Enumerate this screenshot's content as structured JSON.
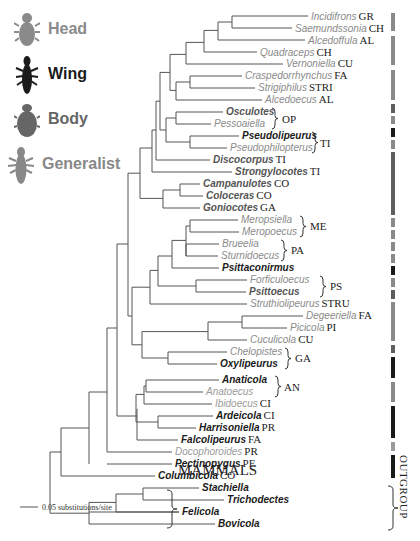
{
  "legend": {
    "items": [
      {
        "label": "Head",
        "color": "#8a8a8a"
      },
      {
        "label": "Wing",
        "color": "#1a1a1a"
      },
      {
        "label": "Body",
        "color": "#666666"
      },
      {
        "label": "Generalist",
        "color": "#888888"
      }
    ]
  },
  "colors": {
    "head": "#8a8a8a",
    "wing": "#1a1a1a",
    "body": "#5e5e5e",
    "generalist": "#9a9a9a",
    "line": "#555555"
  },
  "tips": [
    {
      "name": "Incidifrons",
      "code": "GR",
      "type": "head"
    },
    {
      "name": "Saemundssonia",
      "code": "CH",
      "type": "head"
    },
    {
      "name": "Alcedoffula",
      "code": "AL",
      "type": "head"
    },
    {
      "name": "Quadraceps",
      "code": "CH",
      "type": "head"
    },
    {
      "name": "Vernoniella",
      "code": "CU",
      "type": "head"
    },
    {
      "name": "Craspedorrhynchus",
      "code": "FA",
      "type": "head"
    },
    {
      "name": "Strigiphilus",
      "code": "STRI",
      "type": "head"
    },
    {
      "name": "Alcedoecus",
      "code": "AL",
      "type": "head"
    },
    {
      "name": "Osculotes",
      "code": "",
      "type": "body"
    },
    {
      "name": "Pessoaiella",
      "code": "",
      "type": "head"
    },
    {
      "name": "Pseudolipeurus",
      "code": "",
      "type": "wing"
    },
    {
      "name": "Pseudophilopterus",
      "code": "",
      "type": "head"
    },
    {
      "name": "Discocorpus",
      "code": "TI",
      "type": "body"
    },
    {
      "name": "Strongylocotes",
      "code": "TI",
      "type": "body"
    },
    {
      "name": "Campanulotes",
      "code": "CO",
      "type": "body"
    },
    {
      "name": "Coloceras",
      "code": "CO",
      "type": "body"
    },
    {
      "name": "Goniocotes",
      "code": "GA",
      "type": "body"
    },
    {
      "name": "Meropsiella",
      "code": "",
      "type": "head"
    },
    {
      "name": "Meropoecus",
      "code": "",
      "type": "head"
    },
    {
      "name": "Brueelia",
      "code": "",
      "type": "head"
    },
    {
      "name": "Sturnidoecus",
      "code": "",
      "type": "head"
    },
    {
      "name": "Psittaconirmus",
      "code": "",
      "type": "wing"
    },
    {
      "name": "Forficuloecus",
      "code": "",
      "type": "head"
    },
    {
      "name": "Psittoecus",
      "code": "",
      "type": "body"
    },
    {
      "name": "Struthiolipeurus",
      "code": "STRU",
      "type": "head"
    },
    {
      "name": "Degeeriella",
      "code": "FA",
      "type": "head"
    },
    {
      "name": "Picicola",
      "code": "PI",
      "type": "head"
    },
    {
      "name": "Cuculicola",
      "code": "CU",
      "type": "head"
    },
    {
      "name": "Chelopistes",
      "code": "",
      "type": "head"
    },
    {
      "name": "Oxylipeurus",
      "code": "",
      "type": "wing"
    },
    {
      "name": "Anaticola",
      "code": "",
      "type": "wing"
    },
    {
      "name": "Anatoecus",
      "code": "",
      "type": "generalist"
    },
    {
      "name": "Ibidoecus",
      "code": "CI",
      "type": "generalist"
    },
    {
      "name": "Ardeicola",
      "code": "CI",
      "type": "wing"
    },
    {
      "name": "Harrisoniella",
      "code": "PR",
      "type": "wing"
    },
    {
      "name": "Falcolipeurus",
      "code": "FA",
      "type": "wing"
    },
    {
      "name": "Docophoroides",
      "code": "PR",
      "type": "generalist"
    },
    {
      "name": "Pectinopygus",
      "code": "PE",
      "type": "wing"
    },
    {
      "name": "Columbicola",
      "code": "CO",
      "type": "wing"
    },
    {
      "name": "Stachiella",
      "code": "",
      "type": "wing"
    },
    {
      "name": "Trichodectes",
      "code": "",
      "type": "wing"
    },
    {
      "name": "Felicola",
      "code": "",
      "type": "wing"
    },
    {
      "name": "Bovicola",
      "code": "",
      "type": "wing"
    }
  ],
  "groups": [
    {
      "label": "OP",
      "tips": [
        "Osculotes",
        "Pessoaiella"
      ]
    },
    {
      "label": "TI",
      "tips": [
        "Pseudolipeurus",
        "Pseudophilopterus"
      ]
    },
    {
      "label": "ME",
      "tips": [
        "Meropsiella",
        "Meropoecus"
      ]
    },
    {
      "label": "PA",
      "tips": [
        "Brueelia",
        "Sturnidoecus"
      ]
    },
    {
      "label": "PS",
      "tips": [
        "Forficuloecus",
        "Psittoecus"
      ]
    },
    {
      "label": "GA",
      "tips": [
        "Chelopistes",
        "Oxylipeurus"
      ]
    },
    {
      "label": "AN",
      "tips": [
        "Anaticola",
        "Anatoecus"
      ]
    },
    {
      "label": "MAMMALS",
      "tips": [
        "Stachiella",
        "Trichodectes",
        "Felicola",
        "Bovicola"
      ]
    }
  ],
  "outgroup_label": "OUTGROUP",
  "scale_bar": {
    "label": "0.05 substitutions/site"
  }
}
